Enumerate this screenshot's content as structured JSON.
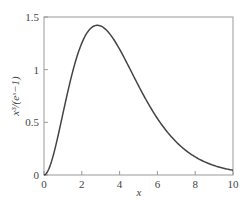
{
  "chart_data": {
    "type": "line",
    "title": "",
    "xlabel": "x",
    "ylabel": "x³/(eˣ−1)",
    "function": "x^3/(e^x-1)",
    "xlim": [
      0,
      10
    ],
    "ylim": [
      0,
      1.5
    ],
    "xticks": [
      0,
      2,
      4,
      6,
      8,
      10
    ],
    "yticks": [
      0,
      0.5,
      1,
      1.5
    ],
    "xtick_labels": [
      "0",
      "2",
      "4",
      "6",
      "8",
      "10"
    ],
    "ytick_labels": [
      "0",
      "0.5",
      "1",
      "1.5"
    ],
    "grid": false,
    "legend": null,
    "series": [
      {
        "name": "x³/(eˣ−1)",
        "x": [
          0,
          0.5,
          1,
          1.5,
          2,
          2.5,
          2.82,
          3,
          3.5,
          4,
          4.5,
          5,
          5.5,
          6,
          6.5,
          7,
          7.5,
          8,
          8.5,
          9,
          9.5,
          10
        ],
        "y": [
          0,
          0.193,
          0.582,
          0.967,
          1.252,
          1.404,
          1.421,
          1.419,
          1.344,
          1.194,
          1.024,
          0.847,
          0.68,
          0.535,
          0.412,
          0.313,
          0.234,
          0.172,
          0.126,
          0.09,
          0.064,
          0.045
        ]
      }
    ],
    "colors": {
      "line": "#444444",
      "axes": "#999999",
      "text": "#444444"
    }
  }
}
